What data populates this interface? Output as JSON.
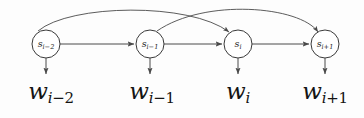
{
  "diagram": {
    "type": "graphical-model",
    "title": "",
    "background_color": "#fdfdfd",
    "stroke_color": "#4a4a4a",
    "node_fill": "#ffffff",
    "states": [
      {
        "id": "s-i-2",
        "base": "s",
        "sub": "i−2",
        "sub_var": "i",
        "sub_op": "−",
        "sub_num": "2",
        "cx": 46,
        "cy": 44,
        "r": 14
      },
      {
        "id": "s-i-1",
        "base": "s",
        "sub": "i−1",
        "sub_var": "i",
        "sub_op": "−",
        "sub_num": "1",
        "cx": 150,
        "cy": 44,
        "r": 14
      },
      {
        "id": "s-i",
        "base": "s",
        "sub": "i",
        "sub_var": "i",
        "sub_op": "",
        "sub_num": "",
        "cx": 238,
        "cy": 44,
        "r": 14
      },
      {
        "id": "s-i+1",
        "base": "s",
        "sub": "i+1",
        "sub_var": "i",
        "sub_op": "+",
        "sub_num": "1",
        "cx": 325,
        "cy": 44,
        "r": 14
      }
    ],
    "observations": [
      {
        "id": "w-i-2",
        "base": "w",
        "sub_var": "i",
        "sub_op": "−",
        "sub_num": "2",
        "x": 51,
        "y": 80
      },
      {
        "id": "w-i-1",
        "base": "w",
        "sub_var": "i",
        "sub_op": "−",
        "sub_num": "1",
        "x": 152,
        "y": 80
      },
      {
        "id": "w-i",
        "base": "w",
        "sub_var": "i",
        "sub_op": "",
        "sub_num": "",
        "x": 238,
        "y": 80
      },
      {
        "id": "w-i+1",
        "base": "w",
        "sub_var": "i",
        "sub_op": "+",
        "sub_num": "1",
        "x": 325,
        "y": 80
      }
    ],
    "chain_edges": [
      {
        "from": "s-i-2",
        "to": "s-i-1"
      },
      {
        "from": "s-i-1",
        "to": "s-i"
      },
      {
        "from": "s-i",
        "to": "s-i+1"
      }
    ],
    "skip_edges": [
      {
        "from": "s-i-2",
        "to": "s-i",
        "peak_y": 10
      },
      {
        "from": "s-i-1",
        "to": "s-i+1",
        "peak_y": 14
      }
    ],
    "emission_edges": [
      {
        "from": "s-i-2",
        "to": "w-i-2"
      },
      {
        "from": "s-i-1",
        "to": "w-i-1"
      },
      {
        "from": "s-i",
        "to": "w-i"
      },
      {
        "from": "s-i+1",
        "to": "w-i+1"
      }
    ]
  }
}
